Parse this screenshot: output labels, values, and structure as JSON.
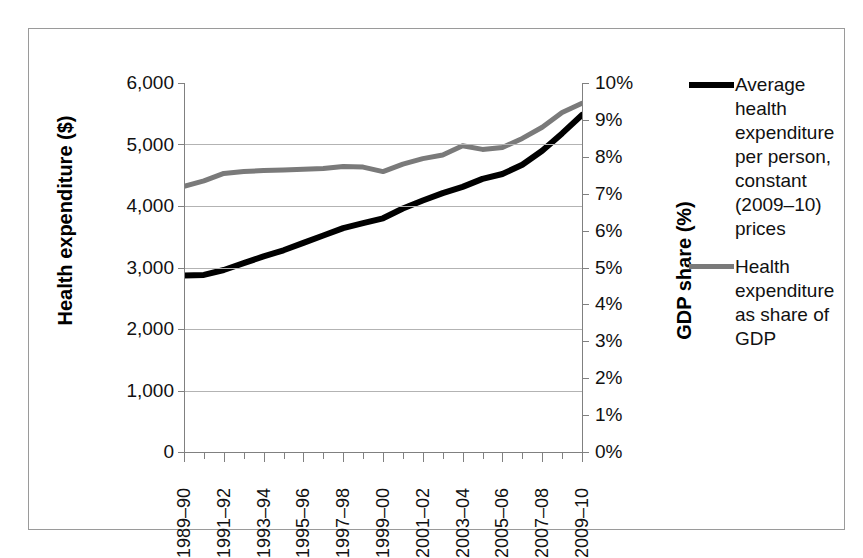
{
  "chart_data": {
    "type": "line",
    "title": "",
    "xlabel": "",
    "ylabel": "Health expenditure ($)",
    "y2label": "GDP share (%)",
    "grid": true,
    "legend_position": "right",
    "ylim": [
      0,
      6000
    ],
    "y2lim": [
      0,
      10
    ],
    "ytick_labels": [
      "6,000",
      "5,000",
      "4,000",
      "3,000",
      "2,000",
      "1,000",
      "0"
    ],
    "ytick_values": [
      6000,
      5000,
      4000,
      3000,
      2000,
      1000,
      0
    ],
    "y2tick_labels": [
      "10%",
      "9%",
      "8%",
      "7%",
      "6%",
      "5%",
      "4%",
      "3%",
      "2%",
      "1%",
      "0%"
    ],
    "y2tick_values": [
      10,
      9,
      8,
      7,
      6,
      5,
      4,
      3,
      2,
      1,
      0
    ],
    "x": [
      "1989-90",
      "1990-91",
      "1991-92",
      "1992-93",
      "1993-94",
      "1994-95",
      "1995-96",
      "1996-97",
      "1997-98",
      "1998-99",
      "1999-00",
      "2000-01",
      "2001-02",
      "2002-03",
      "2003-04",
      "2004-05",
      "2005-06",
      "2006-07",
      "2007-08",
      "2008-09",
      "2009-10"
    ],
    "xtick_labels": [
      "1989–90",
      "1991–92",
      "1993–94",
      "1995–96",
      "1997–98",
      "1999–00",
      "2001–02",
      "2003–04",
      "2005–06",
      "2007–08",
      "2009–10"
    ],
    "xtick_label_indices": [
      0,
      2,
      4,
      6,
      8,
      10,
      12,
      14,
      16,
      18,
      20
    ],
    "series": [
      {
        "name": "Average health expenditure per person, constant (2009–10) prices",
        "axis": "left",
        "color": "#000000",
        "values": [
          2870,
          2880,
          2960,
          3070,
          3180,
          3280,
          3400,
          3520,
          3640,
          3720,
          3800,
          3960,
          4090,
          4210,
          4310,
          4440,
          4520,
          4670,
          4900,
          5180,
          5480
        ]
      },
      {
        "name": "Health expenditure as share of GDP",
        "axis": "right",
        "color": "#7a7a7a",
        "values": [
          7.2,
          7.35,
          7.55,
          7.6,
          7.63,
          7.64,
          7.66,
          7.68,
          7.74,
          7.72,
          7.6,
          7.8,
          7.95,
          8.05,
          8.3,
          8.2,
          8.25,
          8.5,
          8.8,
          9.2,
          9.45
        ]
      }
    ]
  },
  "legend": {
    "entries": [
      {
        "label": "Average health expenditure per person, constant (2009–10) prices",
        "color": "#000000",
        "swatch": "black"
      },
      {
        "label": "Health expenditure as share of GDP",
        "color": "#7a7a7a",
        "swatch": "gray"
      }
    ]
  },
  "axes": {
    "left_title": "Health expenditure ($)",
    "right_title": "GDP share (%)"
  }
}
